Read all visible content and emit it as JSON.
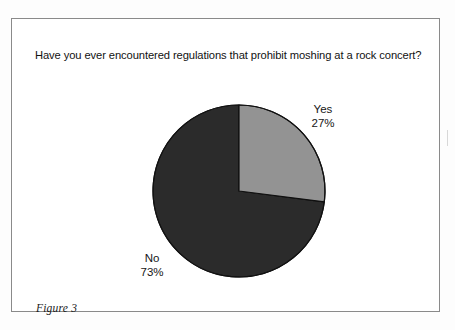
{
  "figure": {
    "title": "Have you ever encountered regulations that prohibit moshing at a rock concert?",
    "caption": "Figure 3"
  },
  "chart_data": {
    "type": "pie",
    "title": "Have you ever encountered regulations that prohibit moshing at a rock concert?",
    "categories": [
      "Yes",
      "No"
    ],
    "values": [
      27,
      73
    ],
    "value_labels": [
      "27%",
      "73%"
    ],
    "units": "percent",
    "total": 100,
    "start_angle_deg": 0,
    "direction": "clockwise",
    "legend": "none",
    "labels_position": "outside",
    "slices": [
      {
        "name": "Yes",
        "value": 27,
        "label": "Yes",
        "percent_label": "27%",
        "color": "#939393",
        "start_deg": 0,
        "end_deg": 97.2
      },
      {
        "name": "No",
        "value": 73,
        "label": "No",
        "percent_label": "73%",
        "color": "#2b2b2b",
        "start_deg": 97.2,
        "end_deg": 360
      }
    ],
    "geometry": {
      "center_x": 227,
      "center_y": 172,
      "radius": 86
    },
    "colors": {
      "yes": "#939393",
      "no": "#2b2b2b",
      "outline": "#101010",
      "frame": "#8a8a8a",
      "background": "#ffffff"
    }
  }
}
